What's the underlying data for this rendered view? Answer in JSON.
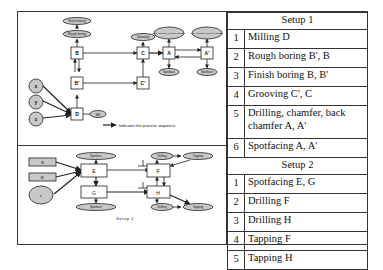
{
  "setup1_diagram": {
    "nodes": {
      "finish_boring": "Finish boring",
      "rough_boring": "Rough boring",
      "grooving": "Grooving",
      "drill_chamfer_1": "Drill, chamfer & back chamfer",
      "drill_chamfer_2": "Drill, chamfer & back chamfer",
      "spotface_1": "Spotface",
      "spotface_2": "Spotface",
      "B_top": "B",
      "B_bottom": "B'",
      "C_top": "C",
      "C_bottom": "C'",
      "A": "A",
      "A_prime": "A'",
      "D": "D",
      "mill": "Mill",
      "x": "x",
      "y": "y",
      "z": "z"
    },
    "legend": "Indicates the process sequence"
  },
  "setup2_diagram": {
    "caption": "Setup 2",
    "nodes": {
      "B": "B",
      "B_prime": "B'",
      "z": "z",
      "E": "E",
      "G": "G",
      "F": "F",
      "H": "H",
      "spotface_top": "Spotface",
      "spotface_bottom": "Spotface",
      "drilling_top": "Drilling",
      "tapping_top": "Tapping",
      "drilling_bottom": "Drilling",
      "tapping_bottom": "Tapping",
      "perp_symbol": "⊥"
    }
  },
  "table": {
    "setup1": {
      "header": "Setup 1",
      "rows": [
        {
          "num": "1",
          "op": "Milling D"
        },
        {
          "num": "2",
          "op": "Rough boring B', B"
        },
        {
          "num": "3",
          "op": "Finish boring B, B'"
        },
        {
          "num": "4",
          "op": "Grooving C', C"
        },
        {
          "num": "5",
          "op": "Drilling, chamfer, back chamfer A, A'"
        },
        {
          "num": "6",
          "op": "Spotfacing A, A'"
        }
      ]
    },
    "setup2": {
      "header": "Setup 2",
      "rows": [
        {
          "num": "1",
          "op": "Spotfacing E, G"
        },
        {
          "num": "2",
          "op": "Drilling F"
        },
        {
          "num": "3",
          "op": "Drilling H"
        },
        {
          "num": "4",
          "op": "Tapping F"
        },
        {
          "num": "5",
          "op": "Tapping H"
        }
      ]
    }
  },
  "colors": {
    "ellipse_fill": "#c8c8c8",
    "line": "#222222"
  }
}
